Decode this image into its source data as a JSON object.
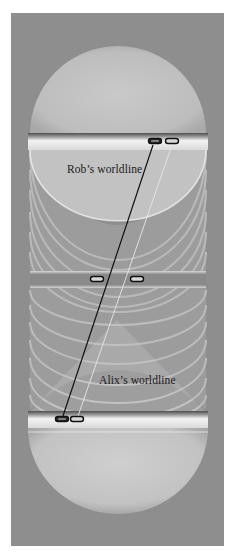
{
  "diagram": {
    "type": "spacetime-worldlines",
    "panel": {
      "x": 11,
      "y": 13,
      "width": 213,
      "height": 533,
      "background": "#8e8e8e"
    },
    "labels": [
      {
        "id": "rob",
        "text": "Rob’s worldline",
        "x": 67,
        "y": 163
      },
      {
        "id": "alix",
        "text": "Alix’s worldline",
        "x": 99,
        "y": 374
      }
    ],
    "worldlines": [
      {
        "id": "rob",
        "name": "Rob’s worldline",
        "color": "#111111",
        "width": 1.2,
        "from": [
          153,
          145
        ],
        "to": [
          62,
          419
        ]
      },
      {
        "id": "alix",
        "name": "Alix’s worldline",
        "color": "#e6e6e6",
        "width": 0.9,
        "from": [
          172,
          145
        ],
        "to": [
          77,
          419
        ]
      }
    ],
    "slices": [
      {
        "id": "top",
        "y": 133,
        "height": 17,
        "capsules": [
          {
            "owner": "rob",
            "cx": 155,
            "cy": 141,
            "style": "filled"
          },
          {
            "owner": "alix",
            "cx": 172,
            "cy": 141,
            "style": "outline"
          }
        ]
      },
      {
        "id": "middle",
        "y": 272,
        "height": 16,
        "capsules": [
          {
            "owner": "rob",
            "cx": 97,
            "cy": 279,
            "style": "outline"
          },
          {
            "owner": "alix",
            "cx": 137,
            "cy": 279,
            "style": "outline"
          }
        ]
      },
      {
        "id": "bottom",
        "y": 412,
        "height": 17,
        "capsules": [
          {
            "owner": "rob",
            "cx": 62,
            "cy": 419,
            "style": "filled"
          },
          {
            "owner": "alix",
            "cx": 77,
            "cy": 419,
            "style": "outline"
          }
        ]
      }
    ],
    "colors": {
      "panel": "#8e8e8e",
      "dome": "#c4c4c4",
      "band_light": "#ececec",
      "band_dark": "#5a5a5a",
      "ring": "#e2e2e2",
      "capsule_stroke": "#111111"
    }
  }
}
